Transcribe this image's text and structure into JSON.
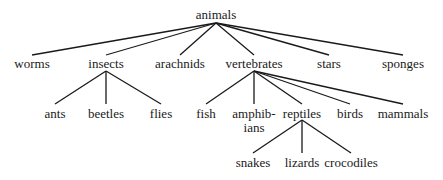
{
  "diagram": {
    "type": "tree",
    "title": "animals",
    "nodes": [
      {
        "id": "animals",
        "label": "animals",
        "x": 216,
        "y": 8,
        "anchor_top": 23,
        "anchor_bottom": 23
      },
      {
        "id": "worms",
        "label": "worms",
        "x": 32,
        "y": 57,
        "anchor_top": 55
      },
      {
        "id": "insects",
        "label": "insects",
        "x": 106,
        "y": 57,
        "anchor_top": 55,
        "anchor_bottom": 71
      },
      {
        "id": "arachnids",
        "label": "arachnids",
        "x": 180,
        "y": 57,
        "anchor_top": 55
      },
      {
        "id": "vertebrates",
        "label": "vertebrates",
        "x": 254,
        "y": 57,
        "anchor_top": 55,
        "anchor_bottom": 71
      },
      {
        "id": "stars",
        "label": "stars",
        "x": 329,
        "y": 57,
        "anchor_top": 55
      },
      {
        "id": "sponges",
        "label": "sponges",
        "x": 403,
        "y": 57,
        "anchor_top": 55
      },
      {
        "id": "ants",
        "label": "ants",
        "x": 55,
        "y": 107,
        "anchor_top": 104
      },
      {
        "id": "beetles",
        "label": "beetles",
        "x": 106,
        "y": 107,
        "anchor_top": 104
      },
      {
        "id": "flies",
        "label": "flies",
        "x": 161,
        "y": 107,
        "anchor_top": 104
      },
      {
        "id": "fish",
        "label": "fish",
        "x": 206,
        "y": 107,
        "anchor_top": 104
      },
      {
        "id": "amphibians",
        "label": "amphib-",
        "label2": "ians",
        "x": 254,
        "y": 107,
        "anchor_top": 104
      },
      {
        "id": "reptiles",
        "label": "reptiles",
        "x": 302,
        "y": 107,
        "anchor_top": 104,
        "anchor_bottom": 120
      },
      {
        "id": "birds",
        "label": "birds",
        "x": 350,
        "y": 107,
        "anchor_top": 104
      },
      {
        "id": "mammals",
        "label": "mammals",
        "x": 403,
        "y": 107,
        "anchor_top": 104
      },
      {
        "id": "snakes",
        "label": "snakes",
        "x": 253,
        "y": 156,
        "anchor_top": 153
      },
      {
        "id": "lizards",
        "label": "lizards",
        "x": 302,
        "y": 156,
        "anchor_top": 153
      },
      {
        "id": "crocodiles",
        "label": "crocodiles",
        "x": 351,
        "y": 156,
        "anchor_top": 153
      }
    ],
    "edges": [
      [
        "animals",
        "worms"
      ],
      [
        "animals",
        "insects"
      ],
      [
        "animals",
        "arachnids"
      ],
      [
        "animals",
        "vertebrates"
      ],
      [
        "animals",
        "stars"
      ],
      [
        "animals",
        "sponges"
      ],
      [
        "insects",
        "ants"
      ],
      [
        "insects",
        "beetles"
      ],
      [
        "insects",
        "flies"
      ],
      [
        "vertebrates",
        "fish"
      ],
      [
        "vertebrates",
        "amphibians"
      ],
      [
        "vertebrates",
        "reptiles"
      ],
      [
        "vertebrates",
        "birds"
      ],
      [
        "vertebrates",
        "mammals"
      ],
      [
        "reptiles",
        "snakes"
      ],
      [
        "reptiles",
        "lizards"
      ],
      [
        "reptiles",
        "crocodiles"
      ]
    ],
    "colors": {
      "line": "#1a1a1a",
      "text": "#1a1a1a",
      "background": "#ffffff"
    }
  }
}
